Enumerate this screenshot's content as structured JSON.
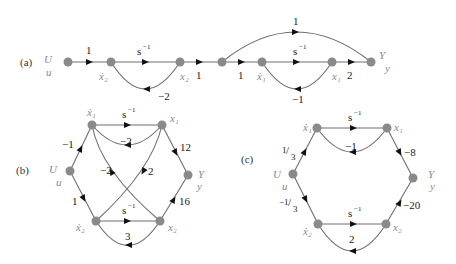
{
  "colors": {
    "node": "#8a8a8a",
    "edge": "#6e6e6e",
    "arrow": "#111111",
    "text": "#1a1a1a",
    "label": "#8a8a8a"
  },
  "a": {
    "tag": "(a)",
    "labels": {
      "U": "U",
      "u": "u",
      "x2dot": "ẋ₂",
      "x2": "x₂",
      "x1dot": "ẋ₁",
      "x1": "x₁",
      "Y": "Y",
      "y": "y"
    },
    "weights": {
      "u_x2dot": "1",
      "int2": "s",
      "int2_exp": "−1",
      "fb2": "−2",
      "x2_mid": "1",
      "mid_x1dot": "1",
      "int1": "s",
      "int1_exp": "−1",
      "fb1": "−1",
      "x1_y": "2",
      "mid_y": "1"
    }
  },
  "b": {
    "tag": "(b)",
    "labels": {
      "U": "U",
      "u": "u",
      "x1dot": "ẋ₁",
      "x1": "x₁",
      "x2dot": "ẋ₂",
      "x2": "x₂",
      "Y": "Y",
      "y": "y"
    },
    "weights": {
      "u_x1dot": "−1",
      "u_x2dot": "1",
      "int1": "s",
      "int1_exp": "−1",
      "fb1": "−2",
      "x2_x1dot": "−2",
      "x1_x2dot": "2",
      "x1_y": "12",
      "x2_y": "16",
      "int2": "s",
      "int2_exp": "−1",
      "fb2": "3"
    }
  },
  "c": {
    "tag": "(c)",
    "labels": {
      "U": "U",
      "u": "u",
      "x1dot": "ẋ₁",
      "x1": "x₁",
      "x2dot": "ẋ₂",
      "x2": "x₂",
      "Y": "Y",
      "y": "y"
    },
    "weights": {
      "u_x1dot_num": "1",
      "u_x1dot_den": "3",
      "u_x2dot_num": "−1",
      "u_x2dot_den": "3",
      "int1": "s",
      "int1_exp": "−1",
      "fb1": "−1",
      "x1_y": "−8",
      "x2_y": "−20",
      "int2": "s",
      "int2_exp": "−1",
      "fb2": "2"
    }
  }
}
